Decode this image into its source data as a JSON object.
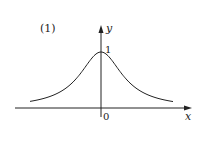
{
  "figure": {
    "label": "(1)",
    "y_axis_label": "y",
    "x_axis_label": "x",
    "origin_label": "0",
    "peak_label": "1",
    "curve_function": "y = 1/(1+x^2)",
    "colors": {
      "stroke": "#222222",
      "background": "#ffffff"
    }
  }
}
